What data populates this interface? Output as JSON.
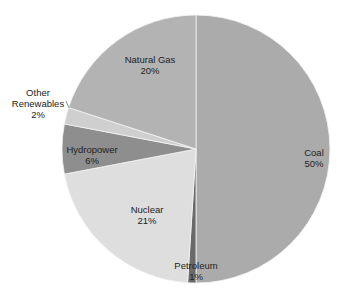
{
  "chart_data": {
    "type": "pie",
    "title": "",
    "start_angle": "12 o'clock",
    "direction": "clockwise",
    "slices": [
      {
        "label": "Coal",
        "value": 50,
        "pct_label": "50%",
        "color": "#ababab"
      },
      {
        "label": "Petroleum",
        "value": 1,
        "pct_label": "1%",
        "color": "#6a6a6a"
      },
      {
        "label": "Nuclear",
        "value": 21,
        "pct_label": "21%",
        "color": "#dedede"
      },
      {
        "label": "Hydropower",
        "value": 6,
        "pct_label": "6%",
        "color": "#8e8e8e"
      },
      {
        "label": "Other Renewables",
        "value": 2,
        "pct_label": "2%",
        "color": "#cfcfcf"
      },
      {
        "label": "Natural Gas",
        "value": 20,
        "pct_label": "20%",
        "color": "#b3b3b3"
      }
    ],
    "categories": [
      "Coal",
      "Petroleum",
      "Nuclear",
      "Hydropower",
      "Other Renewables",
      "Natural Gas"
    ],
    "values": [
      50,
      1,
      21,
      6,
      2,
      20
    ],
    "legend": "none (data labels on slices)"
  },
  "labels": {
    "coal": {
      "name": "Coal",
      "pct": "50%"
    },
    "petroleum": {
      "name": "Petroleum",
      "pct": "1%"
    },
    "nuclear": {
      "name": "Nuclear",
      "pct": "21%"
    },
    "hydropower": {
      "name": "Hydropower",
      "pct": "6%"
    },
    "other_renewables": {
      "name_line1": "Other",
      "name_line2": "Renewables",
      "pct": "2%"
    },
    "natural_gas": {
      "name": "Natural Gas",
      "pct": "20%"
    }
  }
}
